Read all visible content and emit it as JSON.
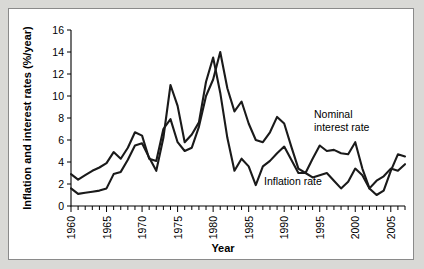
{
  "chart_data": {
    "type": "line",
    "title": "",
    "xlabel": "Year",
    "ylabel": "Inflation and interest rates (%/year)",
    "xlim": [
      1960,
      2007
    ],
    "ylim": [
      0,
      16
    ],
    "ytick_labels": [
      "0",
      "2",
      "4",
      "6",
      "8",
      "10",
      "12",
      "14",
      "16"
    ],
    "yticks": [
      0,
      2,
      4,
      6,
      8,
      10,
      12,
      14,
      16
    ],
    "xtick_labels": [
      "1960",
      "1965",
      "1970",
      "1975",
      "1980",
      "1985",
      "1990",
      "1995",
      "2000",
      "2005"
    ],
    "xticks": [
      1960,
      1965,
      1970,
      1975,
      1980,
      1985,
      1990,
      1995,
      2000,
      2005
    ],
    "minor_xtick_interval": 1,
    "grid": false,
    "legend": "annotations",
    "x": [
      1960,
      1961,
      1962,
      1963,
      1964,
      1965,
      1966,
      1967,
      1968,
      1969,
      1970,
      1971,
      1972,
      1973,
      1974,
      1975,
      1976,
      1977,
      1978,
      1979,
      1980,
      1981,
      1982,
      1983,
      1984,
      1985,
      1986,
      1987,
      1988,
      1989,
      1990,
      1991,
      1992,
      1993,
      1994,
      1995,
      1996,
      1997,
      1998,
      1999,
      2000,
      2001,
      2002,
      2003,
      2004,
      2005,
      2006,
      2007
    ],
    "series": [
      {
        "name": "Nominal interest rate",
        "color": "#1a1a1a",
        "annotation": "Nominal\ninterest rate",
        "values": [
          2.9,
          2.4,
          2.8,
          3.2,
          3.5,
          3.9,
          4.9,
          4.3,
          5.3,
          6.7,
          6.4,
          4.3,
          4.1,
          7.0,
          7.9,
          5.8,
          5.0,
          5.3,
          7.2,
          10.0,
          11.5,
          14.0,
          10.7,
          8.6,
          9.5,
          7.5,
          6.0,
          5.8,
          6.7,
          8.1,
          7.5,
          5.4,
          3.4,
          3.0,
          4.3,
          5.5,
          5.0,
          5.1,
          4.8,
          4.7,
          5.8,
          3.4,
          1.6,
          1.0,
          1.4,
          3.2,
          4.7,
          4.5
        ]
      },
      {
        "name": "Inflation rate",
        "color": "#1a1a1a",
        "annotation": "Inflation rate",
        "values": [
          1.6,
          1.1,
          1.2,
          1.3,
          1.4,
          1.6,
          2.9,
          3.1,
          4.2,
          5.5,
          5.7,
          4.4,
          3.2,
          6.2,
          11.0,
          9.1,
          5.8,
          6.5,
          7.6,
          11.3,
          13.5,
          10.3,
          6.2,
          3.2,
          4.3,
          3.6,
          1.9,
          3.6,
          4.1,
          4.8,
          5.4,
          4.2,
          3.0,
          3.0,
          2.6,
          2.8,
          3.0,
          2.3,
          1.6,
          2.2,
          3.4,
          2.8,
          1.6,
          2.3,
          2.7,
          3.4,
          3.2,
          3.8
        ]
      }
    ],
    "annotations": [
      {
        "id": "nominal-label",
        "text_line1": "Nominal",
        "text_line2": "interest rate",
        "x_px": 313,
        "y_px": 117
      },
      {
        "id": "inflation-label",
        "text_line1": "Inflation rate",
        "text_line2": "",
        "x_px": 263,
        "y_px": 184
      }
    ]
  }
}
